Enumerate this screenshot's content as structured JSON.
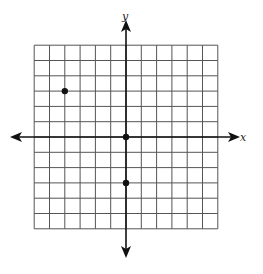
{
  "diagram": {
    "type": "coordinate-plane",
    "axes": {
      "x_label": "x",
      "y_label": "y"
    },
    "grid": {
      "x_min": -6,
      "x_max": 6,
      "y_min": -6,
      "y_max": 6,
      "step": 1
    },
    "points": [
      {
        "x": -4,
        "y": 3
      },
      {
        "x": 0,
        "y": 0
      },
      {
        "x": 0,
        "y": -3
      }
    ],
    "colors": {
      "grid": "#555555",
      "axis": "#111111",
      "point": "#111111"
    }
  }
}
